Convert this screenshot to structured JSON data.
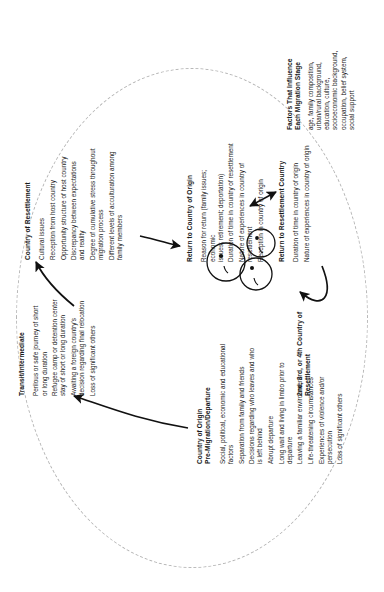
{
  "figure": {
    "orientation": "rotated-90-ccw",
    "background_color": "#ffffff",
    "outline_color": "#b7b7b7",
    "text_color": "#1a1a1a"
  },
  "stages": {
    "transit": {
      "title": "Transit/Intermediate",
      "items": [
        "Perilous or safe journey of short\nor long duration",
        "Refugee camp or detention center\nstay of short or long duration",
        "Awaiting a foreign country's\ndecision regarding final relocation",
        "Loss of significant others"
      ]
    },
    "resettlement": {
      "title": "Country of Resettlement",
      "items": [
        "Cultural issues",
        "Reception from host country",
        "Opportunity structure of host country",
        "Discrepancy between expectations\nand reality",
        "Degree of cumulative stress throughout\nmigration process",
        "Different levels of acculturation among\nfamily members"
      ]
    },
    "origin": {
      "title": "Country of Origin\nPre-Migration/Departure",
      "items": [
        "Social, political, economic and educational\nfactors",
        "Separation from family and friends",
        "Decisions regarding who leaves and who\nis left behind",
        "Abrupt departure",
        "Long wait and living in limbo prior to\ndeparture",
        "Leaving a familiar environment",
        "Life-threatening circumstances",
        "Experiences of violence and/or persecution",
        "Loss of significant others"
      ]
    },
    "return_to_origin": {
      "title": "Return to Country of Origin",
      "items": [
        "Reason for return (family issues; economic\nissues; retirement; deportation)",
        "Duration of time in country of resettlement",
        "Nature of experiences in country of\nresettlement",
        "Reception in country of origin"
      ]
    },
    "return_to_resettlement": {
      "title": "Return to Resettlement Country",
      "items": [
        "Duration of time in country of origin",
        "Nature of experiences in country of origin"
      ]
    },
    "nth_country": {
      "title": "2nd, 3rd, or 4th Country of\nResettlement",
      "items": []
    }
  },
  "factors": {
    "title": "Factors That Influence\nEach Migration Stage",
    "body": "age, family composition,\nurban/rural background,\neducation, culture,\nsocioeconomic background,\noccupation, belief system,\nsocial support"
  },
  "icons": {
    "arrow_origin_to_transit": "curved-arrow-icon",
    "arrow_transit_to_resettlement": "curved-arrow-icon",
    "arrow_resettlement_to_return_origin": "curved-arrow-icon",
    "arrow_return_origin_to_return_resettlement": "double-headed-arrow-icon",
    "arrow_return_resettlement_to_nth": "curved-arrow-icon",
    "people_group": "people-group-icon"
  }
}
